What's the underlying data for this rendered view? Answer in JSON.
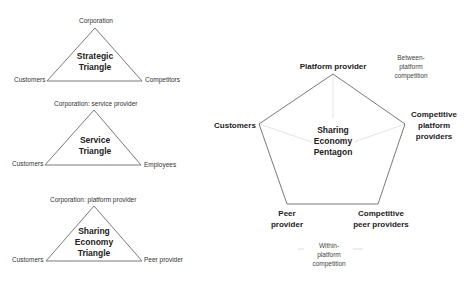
{
  "triangles": [
    {
      "title_line1": "Strategic",
      "title_line2": "Triangle",
      "top": "Corporation",
      "left": "Customers",
      "right": "Competitors"
    },
    {
      "title_line1": "Service",
      "title_line2": "Triangle",
      "top": "Corporation: service provider",
      "left": "Customers",
      "right": "Employees"
    },
    {
      "title_line1": "Sharing",
      "title_line2": "Economy",
      "title_line3": "Triangle",
      "top": "Corporation: platform provider",
      "left": "Customers",
      "right": "Peer provider"
    }
  ],
  "pentagon": {
    "title_line1": "Sharing",
    "title_line2": "Economy",
    "title_line3": "Pentagon",
    "top": "Platform provider",
    "left": "Customers",
    "right_line1": "Competitive",
    "right_line2": "platform",
    "right_line3": "providers",
    "bottom_left_line1": "Peer",
    "bottom_left_line2": "provider",
    "bottom_right_line1": "Competitive",
    "bottom_right_line2": "peer providers",
    "between_line1": "Between-",
    "between_line2": "platform",
    "between_line3": "competition",
    "within_line1": "Within-",
    "within_line2": "platform",
    "within_line3": "competition"
  },
  "colors": {
    "stroke": "#7a7a7a",
    "spoke": "#e2e2e2",
    "text": "#222222"
  }
}
